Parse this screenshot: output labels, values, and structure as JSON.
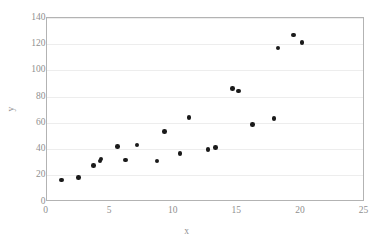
{
  "chart_data": {
    "type": "scatter",
    "title": "",
    "xlabel": "x",
    "ylabel": "y",
    "xlim": [
      0,
      25
    ],
    "ylim": [
      0,
      140
    ],
    "xticks": [
      0,
      5,
      10,
      15,
      20,
      25
    ],
    "yticks": [
      0,
      20,
      40,
      60,
      80,
      100,
      120,
      140
    ],
    "grid": "horizontal",
    "legend": "none",
    "marker": {
      "shape": "circle",
      "color": "#1a1a1a",
      "size": 4.6
    },
    "series": [
      {
        "name": "series-1",
        "points": [
          {
            "x": 1.2,
            "y": 16.5
          },
          {
            "x": 2.5,
            "y": 18.3
          },
          {
            "x": 3.7,
            "y": 27.7
          },
          {
            "x": 4.2,
            "y": 31.0
          },
          {
            "x": 4.3,
            "y": 32.5
          },
          {
            "x": 5.6,
            "y": 41.9
          },
          {
            "x": 6.2,
            "y": 31.8
          },
          {
            "x": 7.1,
            "y": 43.2
          },
          {
            "x": 8.7,
            "y": 31.0
          },
          {
            "x": 9.3,
            "y": 53.3
          },
          {
            "x": 10.5,
            "y": 36.8
          },
          {
            "x": 11.2,
            "y": 63.9
          },
          {
            "x": 12.7,
            "y": 39.9
          },
          {
            "x": 13.3,
            "y": 41.1
          },
          {
            "x": 14.6,
            "y": 86.3
          },
          {
            "x": 15.1,
            "y": 84.3
          },
          {
            "x": 16.2,
            "y": 58.6
          },
          {
            "x": 17.9,
            "y": 63.4
          },
          {
            "x": 18.2,
            "y": 117.0
          },
          {
            "x": 19.4,
            "y": 126.9
          },
          {
            "x": 20.1,
            "y": 121.3
          }
        ]
      }
    ]
  },
  "style": {
    "plot_border_color": "#b3b3b3",
    "gridline_color": "#ededed",
    "tick_label_color": "#8f8f8f",
    "background": "#ffffff"
  }
}
